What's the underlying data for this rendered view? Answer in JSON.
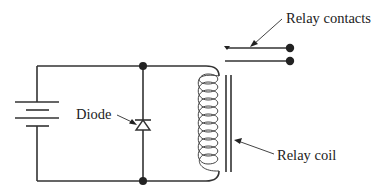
{
  "diagram": {
    "labels": {
      "relay_contacts": "Relay contacts",
      "diode": "Diode",
      "relay_coil": "Relay coil"
    },
    "components": [
      {
        "name": "battery",
        "type": "dc-source"
      },
      {
        "name": "diode",
        "type": "diode",
        "orientation": "cathode-up"
      },
      {
        "name": "relay-coil",
        "type": "inductor",
        "turns": 10
      },
      {
        "name": "relay-core",
        "type": "iron-core"
      },
      {
        "name": "relay-contacts",
        "type": "switch"
      }
    ],
    "colors": {
      "line": "#333333",
      "text": "#222222",
      "background": "#ffffff"
    }
  }
}
